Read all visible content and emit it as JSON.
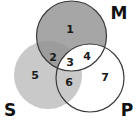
{
  "diagram": {
    "type": "venn-3",
    "sets": [
      {
        "id": "M",
        "label": "M",
        "cx": 71.5,
        "cy": 36,
        "r": 35,
        "fill": "#a6a6a6",
        "stroke": "#3a3a3a",
        "label_x": 119,
        "label_y": 13
      },
      {
        "id": "S",
        "label": "S",
        "cx": 48,
        "cy": 75,
        "r": 34,
        "fill": "#c9c9c9",
        "stroke": "none",
        "label_x": 10,
        "label_y": 110
      },
      {
        "id": "P",
        "label": "P",
        "cx": 90,
        "cy": 78,
        "r": 34,
        "fill": "none",
        "stroke": "#3a3a3a",
        "label_x": 127,
        "label_y": 110
      }
    ],
    "regions": [
      {
        "id": "1",
        "label": "1",
        "x": 70,
        "y": 29,
        "sets": [
          "M"
        ]
      },
      {
        "id": "2",
        "label": "2",
        "x": 53,
        "y": 57,
        "sets": [
          "M",
          "S"
        ]
      },
      {
        "id": "3",
        "label": "3",
        "x": 70,
        "y": 63,
        "sets": [
          "M",
          "S",
          "P"
        ]
      },
      {
        "id": "4",
        "label": "4",
        "x": 87,
        "y": 57,
        "sets": [
          "M",
          "P"
        ]
      },
      {
        "id": "5",
        "label": "5",
        "x": 35,
        "y": 75,
        "sets": [
          "S"
        ]
      },
      {
        "id": "6",
        "label": "6",
        "x": 69,
        "y": 83,
        "sets": [
          "S",
          "P"
        ]
      },
      {
        "id": "7",
        "label": "7",
        "x": 105,
        "y": 77,
        "sets": [
          "P"
        ]
      }
    ],
    "colors": {
      "m_only": "#a6a6a6",
      "m_and_s": "#9c9c9c",
      "s_fill": "#c9c9c9",
      "white": "#ffffff",
      "outline": "#3a3a3a"
    }
  }
}
